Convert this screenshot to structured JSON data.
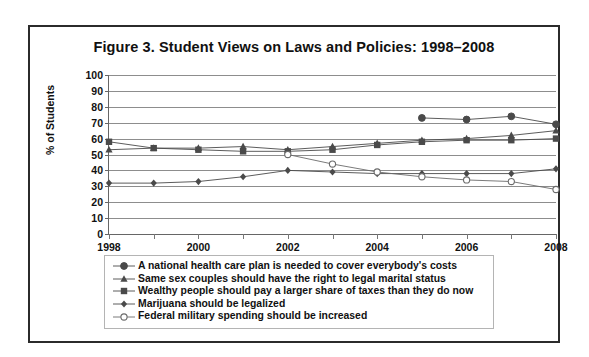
{
  "figure": {
    "title": "Figure 3. Student Views on Laws and Policies: 1998–2008"
  },
  "chart_data": {
    "type": "line",
    "title": "Figure 3. Student Views on Laws and Policies: 1998–2008",
    "xlabel": "",
    "ylabel": "% of Students",
    "x": [
      1998,
      1999,
      2000,
      2001,
      2002,
      2003,
      2004,
      2005,
      2006,
      2007,
      2008
    ],
    "xtick_labels": [
      "1998",
      "2000",
      "2002",
      "2004",
      "2006",
      "2008"
    ],
    "xtick_values": [
      1998,
      2000,
      2002,
      2004,
      2006,
      2008
    ],
    "xlim": [
      1998,
      2008
    ],
    "ylim": [
      0,
      100
    ],
    "ytick_values": [
      0,
      10,
      20,
      30,
      40,
      50,
      60,
      70,
      80,
      90,
      100
    ],
    "ytick_labels": [
      "0",
      "10",
      "20",
      "30",
      "40",
      "50",
      "60",
      "70",
      "80",
      "90",
      "100"
    ],
    "grid": "horizontal",
    "legend_position": "below-axes",
    "series": [
      {
        "name": "A national health care plan is needed to cover everybody's costs",
        "marker": "filled-circle",
        "color": "#4a4a4a",
        "x": [
          2005,
          2006,
          2007,
          2008
        ],
        "values": [
          73,
          72,
          74,
          69
        ]
      },
      {
        "name": "Same sex couples should have the right to legal marital status",
        "marker": "filled-triangle",
        "color": "#4a4a4a",
        "x": [
          1998,
          1999,
          2000,
          2001,
          2002,
          2003,
          2004,
          2005,
          2006,
          2007,
          2008
        ],
        "values": [
          53,
          54,
          54,
          55,
          53,
          55,
          57,
          59,
          60,
          62,
          65
        ]
      },
      {
        "name": "Wealthy people should pay a larger share of taxes than they do now",
        "marker": "filled-square",
        "color": "#4a4a4a",
        "x": [
          1998,
          1999,
          2000,
          2001,
          2002,
          2003,
          2004,
          2005,
          2006,
          2007,
          2008
        ],
        "values": [
          58,
          54,
          53,
          52,
          52,
          53,
          56,
          58,
          59,
          59,
          60
        ]
      },
      {
        "name": "Marijuana should be legalized",
        "marker": "filled-diamond",
        "color": "#4a4a4a",
        "x": [
          1998,
          1999,
          2000,
          2001,
          2002,
          2003,
          2004,
          2005,
          2006,
          2007,
          2008
        ],
        "values": [
          32,
          32,
          33,
          36,
          40,
          39,
          38,
          38,
          38,
          38,
          41
        ]
      },
      {
        "name": "Federal military spending should be increased",
        "marker": "open-circle",
        "color": "#6b6b6b",
        "x": [
          2002,
          2003,
          2004,
          2005,
          2006,
          2007,
          2008
        ],
        "values": [
          50,
          44,
          39,
          36,
          34,
          33,
          28
        ]
      }
    ]
  },
  "legend": {
    "items": [
      {
        "label": "A national health care plan is needed to cover everybody's costs",
        "marker": "filled-circle"
      },
      {
        "label": "Same sex couples should have the right to legal marital status",
        "marker": "filled-triangle"
      },
      {
        "label": "Wealthy people should pay a larger share of taxes than they do now",
        "marker": "filled-square"
      },
      {
        "label": "Marijuana should be legalized",
        "marker": "filled-diamond"
      },
      {
        "label": "Federal military spending should be increased",
        "marker": "open-circle"
      }
    ]
  }
}
